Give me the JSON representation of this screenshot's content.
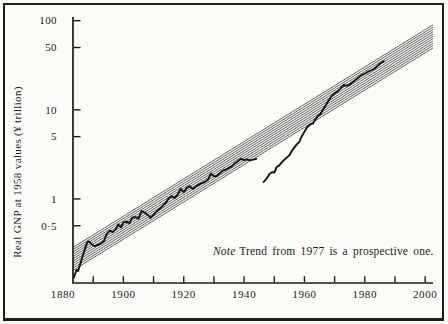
{
  "chart_data": {
    "type": "line",
    "title": "",
    "xlabel": "",
    "ylabel": "Real GNP at 1958 values (¥ trillion)",
    "annotation": {
      "lead_italic": "Note",
      "text": "Trend from 1977 is a prospective one."
    },
    "x_axis": {
      "xlim": [
        1883.3,
        2002.6
      ],
      "minor_tick_years": [
        1890,
        1900,
        1910,
        1920,
        1930,
        1940,
        1950,
        1960,
        1970,
        1980,
        1990,
        2000
      ],
      "label_years": [
        "1880",
        "1900",
        "1920",
        "1940",
        "1960",
        "1980",
        "2000"
      ],
      "label_year_values": [
        1880,
        1900,
        1920,
        1940,
        1960,
        1980,
        2000
      ]
    },
    "y_axis": {
      "scale": "log",
      "ylim": [
        0.114,
        110
      ],
      "ticks": [
        {
          "value": 100,
          "label": "100"
        },
        {
          "value": 50,
          "label": "50"
        },
        {
          "value": 10,
          "label": "10"
        },
        {
          "value": 5,
          "label": "5"
        },
        {
          "value": 1,
          "label": "1"
        },
        {
          "value": 0.5,
          "label": "0·5"
        }
      ]
    },
    "trend_band": {
      "name": "long-run trend channel (hatched, prospective from 1977)",
      "n_lines": 11,
      "year_range": [
        1883.3,
        2002.6
      ],
      "top_values": [
        0.286,
        90
      ],
      "bottom_values": [
        0.158,
        49.5
      ]
    },
    "series": [
      {
        "name": "prewar-actual-gnp",
        "points": [
          [
            1883.5,
            0.13
          ],
          [
            1884.5,
            0.16
          ],
          [
            1885,
            0.155
          ],
          [
            1886,
            0.2
          ],
          [
            1887,
            0.26
          ],
          [
            1888,
            0.325
          ],
          [
            1888.6,
            0.335
          ],
          [
            1889.5,
            0.31
          ],
          [
            1890.5,
            0.295
          ],
          [
            1891.5,
            0.305
          ],
          [
            1892.5,
            0.315
          ],
          [
            1893.5,
            0.335
          ],
          [
            1894.5,
            0.405
          ],
          [
            1895.5,
            0.44
          ],
          [
            1896.5,
            0.425
          ],
          [
            1897.5,
            0.455
          ],
          [
            1898.3,
            0.52
          ],
          [
            1899.2,
            0.48
          ],
          [
            1900,
            0.545
          ],
          [
            1901,
            0.555
          ],
          [
            1902,
            0.535
          ],
          [
            1903,
            0.62
          ],
          [
            1904,
            0.625
          ],
          [
            1905,
            0.6
          ],
          [
            1906,
            0.73
          ],
          [
            1907,
            0.705
          ],
          [
            1908,
            0.665
          ],
          [
            1909,
            0.615
          ],
          [
            1910,
            0.665
          ],
          [
            1911,
            0.725
          ],
          [
            1912,
            0.77
          ],
          [
            1913,
            0.835
          ],
          [
            1914,
            0.9
          ],
          [
            1915,
            1.02
          ],
          [
            1916,
            1.08
          ],
          [
            1917,
            1.02
          ],
          [
            1918,
            1.12
          ],
          [
            1919,
            1.3
          ],
          [
            1920,
            1.19
          ],
          [
            1921,
            1.33
          ],
          [
            1922,
            1.39
          ],
          [
            1923,
            1.29
          ],
          [
            1924,
            1.38
          ],
          [
            1925,
            1.45
          ],
          [
            1926,
            1.5
          ],
          [
            1927,
            1.55
          ],
          [
            1928,
            1.64
          ],
          [
            1929,
            1.93
          ],
          [
            1930,
            1.79
          ],
          [
            1931,
            1.81
          ],
          [
            1932,
            1.96
          ],
          [
            1933,
            2.08
          ],
          [
            1934,
            2.15
          ],
          [
            1935,
            2.23
          ],
          [
            1936,
            2.33
          ],
          [
            1937,
            2.52
          ],
          [
            1938,
            2.66
          ],
          [
            1939,
            2.82
          ],
          [
            1940,
            2.73
          ],
          [
            1941,
            2.78
          ],
          [
            1942,
            2.71
          ],
          [
            1943,
            2.76
          ],
          [
            1944,
            2.82
          ]
        ]
      },
      {
        "name": "postwar-actual-gnp",
        "points": [
          [
            1946.5,
            1.55
          ],
          [
            1947.5,
            1.7
          ],
          [
            1948.5,
            1.92
          ],
          [
            1949.3,
            2.0
          ],
          [
            1950,
            1.98
          ],
          [
            1950.8,
            2.28
          ],
          [
            1951.5,
            2.35
          ],
          [
            1952.5,
            2.58
          ],
          [
            1953.5,
            2.78
          ],
          [
            1954.3,
            2.95
          ],
          [
            1955,
            3.1
          ],
          [
            1955.8,
            3.45
          ],
          [
            1956.5,
            3.72
          ],
          [
            1957.5,
            4.12
          ],
          [
            1958.3,
            4.35
          ],
          [
            1959,
            4.95
          ],
          [
            1960,
            5.7
          ],
          [
            1961,
            6.45
          ],
          [
            1962,
            6.9
          ],
          [
            1962.8,
            7.0
          ],
          [
            1963.5,
            7.7
          ],
          [
            1964.5,
            8.55
          ],
          [
            1965.3,
            8.9
          ],
          [
            1966,
            9.9
          ],
          [
            1967,
            11.2
          ],
          [
            1968,
            12.7
          ],
          [
            1969,
            14.2
          ],
          [
            1970,
            15.3
          ],
          [
            1971,
            16.1
          ],
          [
            1972,
            17.4
          ],
          [
            1973,
            19.0
          ],
          [
            1974,
            18.6
          ],
          [
            1975,
            19.2
          ],
          [
            1976,
            20.5
          ],
          [
            1977,
            21.8
          ],
          [
            1978,
            23.2
          ],
          [
            1979,
            24.6
          ],
          [
            1980,
            25.4
          ],
          [
            1981,
            26.6
          ],
          [
            1982,
            27.6
          ],
          [
            1983,
            28.7
          ],
          [
            1984,
            30.6
          ],
          [
            1985,
            32.8
          ],
          [
            1986.3,
            35.0
          ]
        ]
      }
    ],
    "colors": {
      "ink": "#1b1b1b",
      "band_line": "#2e2e2e",
      "series_line": "#131313"
    }
  }
}
